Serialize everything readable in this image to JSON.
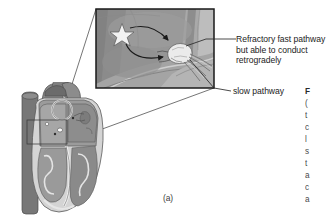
{
  "figure": {
    "panel_label": "(a)",
    "annotations": {
      "fast_pathway": "Refractory fast pathway\nbut able to conduct\nretrogradely",
      "fast_pathway_line1": "Refractory fast pathway",
      "fast_pathway_line2": "but able to conduct",
      "fast_pathway_line3": "retrogradely",
      "slow_pathway": "slow pathway"
    },
    "caption_cropped": {
      "note": "figure caption clipped at right edge of image; only first glyph of each line visible",
      "lines": [
        "F",
        "(",
        "t",
        "c",
        "l",
        "s",
        "t",
        "a",
        "c",
        "a",
        "E"
      ]
    },
    "illustration": {
      "heart": {
        "name": "heart-cross-section",
        "description": "grayscale anatomical cross-section of the heart with great vessels, atria, ventricles and trabeculated walls",
        "magnified_region_marker": "rectangle over the interatrial septum / AV node region"
      },
      "inset": {
        "name": "av-node-magnification",
        "description": "magnified view of atrial tissue showing sinoatrial node, conduction wavefronts and the AV node with dual pathways",
        "sa_node": "star marking the sinoatrial node",
        "av_node": "pale oval marking the atrioventricular node",
        "arrows": [
          "upper curved arrow from SA node toward AV node",
          "lower curved arrow from SA node toward AV node"
        ]
      },
      "magnification_lines": 2
    },
    "colors": {
      "background": "#ffffff",
      "inset_fill": "#969696",
      "inset_border": "#1a1a1a",
      "text": "#1c1c1c",
      "heart_mid": "#8f8f8f",
      "heart_dark": "#6f6f6f",
      "heart_light": "#c9c9c9",
      "node_white": "#f2f2f2",
      "leader_line": "#2b2b2b"
    }
  }
}
